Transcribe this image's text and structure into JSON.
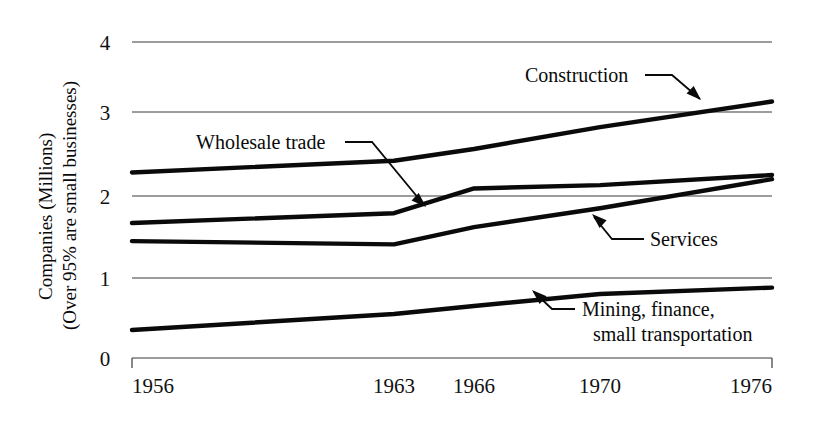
{
  "chart_data": {
    "type": "line",
    "title": "",
    "subtitle": "",
    "xlabel": "",
    "ylabel": "Companies (Millions)",
    "ylabel_line2": "(Over 95% are small businesses)",
    "x": [
      1956,
      1963,
      1966,
      1970,
      1976
    ],
    "xlim": [
      1956,
      1976
    ],
    "ylim": [
      0,
      4
    ],
    "xticks": [
      1956,
      1963,
      1966,
      1970,
      1976
    ],
    "xticklabels": [
      "1956",
      "1963",
      "1966",
      "1970",
      "1976"
    ],
    "yticks": [
      0,
      1,
      2,
      3,
      4
    ],
    "yticklabels": [
      "0",
      "1",
      "2",
      "3",
      "4"
    ],
    "grid": true,
    "legend": "annotations",
    "line_color": "#0a0a0a",
    "grid_color": "#3a3a3a",
    "series": [
      {
        "name": "Construction",
        "values": [
          2.28,
          2.42,
          2.56,
          2.82,
          3.15
        ]
      },
      {
        "name": "Wholesale trade",
        "values": [
          1.67,
          1.79,
          2.09,
          2.13,
          2.25
        ]
      },
      {
        "name": "Services",
        "values": [
          1.45,
          1.41,
          1.62,
          1.85,
          2.2
        ]
      },
      {
        "name": "Mining, finance, small transportation",
        "values": [
          0.35,
          0.55,
          0.65,
          0.8,
          0.88
        ]
      }
    ],
    "annotations": [
      {
        "id": "construction",
        "text": "Construction",
        "text_x": 525,
        "text_y": 82,
        "leader": "M 645 75 L 672 75 L 700 99",
        "arrow_at": [
          701,
          100
        ],
        "arrow_dir": "down-right"
      },
      {
        "id": "wholesale-trade",
        "text": "Wholesale trade",
        "text_x": 196,
        "text_y": 149,
        "leader": "M 345 142 L 372 142 L 424 205",
        "arrow_at": [
          426,
          207
        ],
        "arrow_dir": "down-right"
      },
      {
        "id": "services",
        "text": "Services",
        "text_x": 650,
        "text_y": 246,
        "leader": "M 644 239 L 612 239 L 594 217",
        "arrow_at": [
          592,
          214
        ],
        "arrow_dir": "up-left"
      },
      {
        "id": "mining-finance",
        "text": "Mining, finance,",
        "text_line2": "small transportation",
        "text_x": 582,
        "text_y": 316,
        "text_line2_y": 341,
        "leader": "M 575 309 L 552 309 L 534 292",
        "arrow_at": [
          532,
          290
        ],
        "arrow_dir": "up-left"
      }
    ]
  },
  "axis": {
    "y_title_line1": "Companies (Millions)",
    "y_title_line2": "(Over 95% are small businesses)",
    "y_labels": [
      "4",
      "3",
      "2",
      "1",
      "0"
    ],
    "x_labels": [
      "1956",
      "1963",
      "1966",
      "1970",
      "1976"
    ]
  },
  "labels": {
    "construction": "Construction",
    "wholesale_trade": "Wholesale trade",
    "services": "Services",
    "mining_line1": "Mining, finance,",
    "mining_line2": "small transportation"
  }
}
